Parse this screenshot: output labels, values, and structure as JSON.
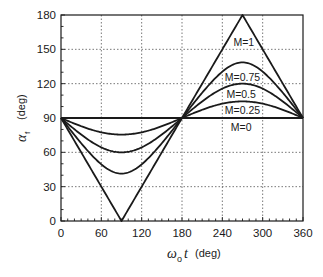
{
  "chart_data": {
    "type": "line",
    "title": "",
    "xlabel": "ω_o t (deg)",
    "ylabel": "α_f (deg)",
    "xlabel_symbol": "ω",
    "xlabel_sub": "o",
    "xlabel_var": "t",
    "xlabel_unit": "(deg)",
    "ylabel_symbol": "α",
    "ylabel_sub": "f",
    "ylabel_unit": "(deg)",
    "xlim": [
      0,
      360
    ],
    "ylim": [
      0,
      180
    ],
    "xticks": [
      0,
      60,
      120,
      180,
      240,
      300,
      360
    ],
    "yticks": [
      0,
      30,
      60,
      90,
      120,
      150,
      180
    ],
    "xtick_labels": [
      "0",
      "60",
      "120",
      "180",
      "240",
      "300",
      "360"
    ],
    "ytick_labels": [
      "0",
      "30",
      "60",
      "90",
      "120",
      "150",
      "180"
    ],
    "grid": true,
    "legend": "inline labels",
    "formula": "alpha_f = 90 - asin(M * sin(omega_o t))",
    "x": [
      0,
      30,
      60,
      90,
      120,
      150,
      180,
      210,
      240,
      270,
      300,
      330,
      360
    ],
    "series": [
      {
        "name": "M=0",
        "M": 0,
        "values": [
          90,
          90,
          90,
          90,
          90,
          90,
          90,
          90,
          90,
          90,
          90,
          90,
          90
        ]
      },
      {
        "name": "M=0.25",
        "M": 0.25,
        "values": [
          90,
          82.8,
          77.5,
          75.5,
          77.5,
          82.8,
          90,
          97.2,
          102.5,
          104.5,
          102.5,
          97.2,
          90
        ]
      },
      {
        "name": "M=0.5",
        "M": 0.5,
        "values": [
          90,
          75.5,
          64.3,
          60,
          64.3,
          75.5,
          90,
          104.5,
          115.7,
          120,
          115.7,
          104.5,
          90
        ]
      },
      {
        "name": "M=0.75",
        "M": 0.75,
        "values": [
          90,
          68,
          49.5,
          41.4,
          49.5,
          68,
          90,
          112,
          130.5,
          138.6,
          130.5,
          112,
          90
        ]
      },
      {
        "name": "M=1",
        "M": 1,
        "values": [
          90,
          60,
          30,
          0,
          30,
          60,
          90,
          120,
          150,
          180,
          150,
          120,
          90
        ]
      }
    ],
    "annotations": [
      {
        "text": "M=1",
        "x": 272,
        "y": 156
      },
      {
        "text": "M=0.75",
        "x": 270,
        "y": 126
      },
      {
        "text": "M=0.5",
        "x": 268,
        "y": 111
      },
      {
        "text": "M=0.25",
        "x": 270,
        "y": 97
      },
      {
        "text": "M=0",
        "x": 268,
        "y": 82
      }
    ]
  }
}
